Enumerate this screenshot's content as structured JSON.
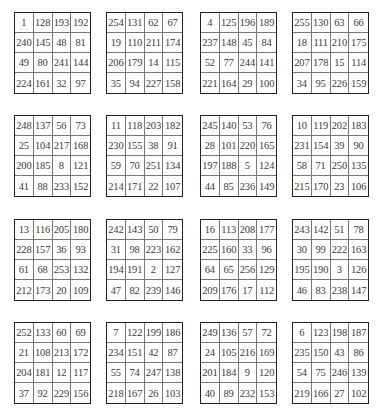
{
  "squares": [
    [
      [
        1,
        128,
        193,
        192
      ],
      [
        240,
        145,
        48,
        81
      ],
      [
        49,
        80,
        241,
        144
      ],
      [
        224,
        161,
        32,
        97
      ]
    ],
    [
      [
        254,
        131,
        62,
        67
      ],
      [
        19,
        110,
        211,
        174
      ],
      [
        206,
        179,
        14,
        115
      ],
      [
        35,
        94,
        227,
        158
      ]
    ],
    [
      [
        4,
        125,
        196,
        189
      ],
      [
        237,
        148,
        45,
        84
      ],
      [
        52,
        77,
        244,
        141
      ],
      [
        221,
        164,
        29,
        100
      ]
    ],
    [
      [
        255,
        130,
        63,
        66
      ],
      [
        18,
        111,
        210,
        175
      ],
      [
        207,
        178,
        15,
        114
      ],
      [
        34,
        95,
        226,
        159
      ]
    ],
    [
      [
        248,
        137,
        56,
        73
      ],
      [
        25,
        104,
        217,
        168
      ],
      [
        200,
        185,
        8,
        121
      ],
      [
        41,
        88,
        233,
        152
      ]
    ],
    [
      [
        11,
        118,
        203,
        182
      ],
      [
        230,
        155,
        38,
        91
      ],
      [
        59,
        70,
        251,
        134
      ],
      [
        214,
        171,
        22,
        107
      ]
    ],
    [
      [
        245,
        140,
        53,
        76
      ],
      [
        28,
        101,
        220,
        165
      ],
      [
        197,
        188,
        5,
        124
      ],
      [
        44,
        85,
        236,
        149
      ]
    ],
    [
      [
        10,
        119,
        202,
        183
      ],
      [
        231,
        154,
        39,
        90
      ],
      [
        58,
        71,
        250,
        135
      ],
      [
        215,
        170,
        23,
        106
      ]
    ],
    [
      [
        13,
        116,
        205,
        180
      ],
      [
        228,
        157,
        36,
        93
      ],
      [
        61,
        68,
        253,
        132
      ],
      [
        212,
        173,
        20,
        109
      ]
    ],
    [
      [
        242,
        143,
        50,
        79
      ],
      [
        31,
        98,
        223,
        162
      ],
      [
        194,
        191,
        2,
        127
      ],
      [
        47,
        82,
        239,
        146
      ]
    ],
    [
      [
        16,
        113,
        208,
        177
      ],
      [
        225,
        160,
        33,
        96
      ],
      [
        64,
        65,
        256,
        129
      ],
      [
        209,
        176,
        17,
        112
      ]
    ],
    [
      [
        243,
        142,
        51,
        78
      ],
      [
        30,
        99,
        222,
        163
      ],
      [
        195,
        190,
        3,
        126
      ],
      [
        46,
        83,
        238,
        147
      ]
    ],
    [
      [
        252,
        133,
        60,
        69
      ],
      [
        21,
        108,
        213,
        172
      ],
      [
        204,
        181,
        12,
        117
      ],
      [
        37,
        92,
        229,
        156
      ]
    ],
    [
      [
        7,
        122,
        199,
        186
      ],
      [
        234,
        151,
        42,
        87
      ],
      [
        55,
        74,
        247,
        138
      ],
      [
        218,
        167,
        26,
        103
      ]
    ],
    [
      [
        249,
        136,
        57,
        72
      ],
      [
        24,
        105,
        216,
        169
      ],
      [
        201,
        184,
        9,
        120
      ],
      [
        40,
        89,
        232,
        153
      ]
    ],
    [
      [
        6,
        123,
        198,
        187
      ],
      [
        235,
        150,
        43,
        86
      ],
      [
        54,
        75,
        246,
        139
      ],
      [
        219,
        166,
        27,
        102
      ]
    ]
  ]
}
